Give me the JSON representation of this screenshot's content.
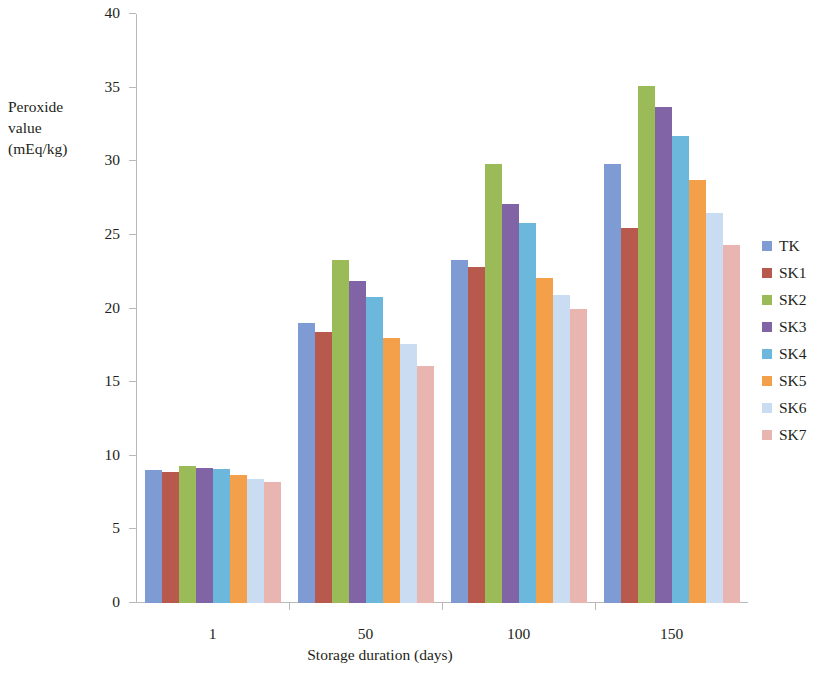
{
  "chart_data": {
    "type": "bar",
    "title": "",
    "xlabel": "Storage duration (days)",
    "ylabel": "Peroxide value (mEq/kg)",
    "ylabel_lines": [
      "Peroxide",
      "value",
      "(mEq/kg)"
    ],
    "categories": [
      "1",
      "50",
      "100",
      "150"
    ],
    "ylim": [
      0,
      40
    ],
    "yticks": [
      0,
      5,
      10,
      15,
      20,
      25,
      30,
      35,
      40
    ],
    "ytick_labels": [
      "0",
      "5",
      "10",
      "15",
      "20",
      "25",
      "30",
      "35",
      "40"
    ],
    "grid": false,
    "legend_position": "right",
    "series": [
      {
        "name": "TK",
        "color": "#7E9BD4",
        "values": [
          9.0,
          19.0,
          23.3,
          29.8
        ]
      },
      {
        "name": "SK1",
        "color": "#B8594E",
        "values": [
          8.9,
          18.4,
          22.8,
          25.5
        ]
      },
      {
        "name": "SK2",
        "color": "#9BBB59",
        "values": [
          9.3,
          23.3,
          29.8,
          35.1
        ]
      },
      {
        "name": "SK3",
        "color": "#8164A5",
        "values": [
          9.2,
          21.9,
          27.1,
          33.7
        ]
      },
      {
        "name": "SK4",
        "color": "#6BB8DC",
        "values": [
          9.1,
          20.8,
          25.8,
          31.7
        ]
      },
      {
        "name": "SK5",
        "color": "#F4A04A",
        "values": [
          8.7,
          18.0,
          22.1,
          28.7
        ]
      },
      {
        "name": "SK6",
        "color": "#C9DCF2",
        "values": [
          8.4,
          17.6,
          20.9,
          26.5
        ]
      },
      {
        "name": "SK7",
        "color": "#E8B5B0",
        "values": [
          8.2,
          16.1,
          20.0,
          24.3
        ]
      }
    ]
  },
  "legend": {
    "items": [
      {
        "label": "TK",
        "color": "#7E9BD4"
      },
      {
        "label": "SK1",
        "color": "#B8594E"
      },
      {
        "label": "SK2",
        "color": "#9BBB59"
      },
      {
        "label": "SK3",
        "color": "#8164A5"
      },
      {
        "label": "SK4",
        "color": "#6BB8DC"
      },
      {
        "label": "SK5",
        "color": "#F4A04A"
      },
      {
        "label": "SK6",
        "color": "#C9DCF2"
      },
      {
        "label": "SK7",
        "color": "#E8B5B0"
      }
    ]
  }
}
